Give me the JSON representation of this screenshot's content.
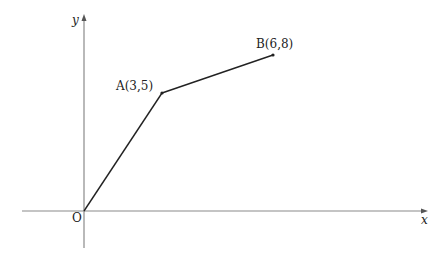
{
  "diagram": {
    "type": "coordinate-graph",
    "axes": {
      "x_label": "x",
      "y_label": "y",
      "origin_label": "O"
    },
    "points": [
      {
        "name": "O",
        "x": 0,
        "y": 0,
        "label": "O"
      },
      {
        "name": "A",
        "x": 3,
        "y": 5,
        "label": "A(3,5)"
      },
      {
        "name": "B",
        "x": 6,
        "y": 8,
        "label": "B(6,8)"
      }
    ],
    "segments": [
      {
        "from": "O",
        "to": "A"
      },
      {
        "from": "A",
        "to": "B"
      }
    ],
    "colors": {
      "axis": "#888888",
      "line": "#222222",
      "text": "#222222"
    }
  }
}
